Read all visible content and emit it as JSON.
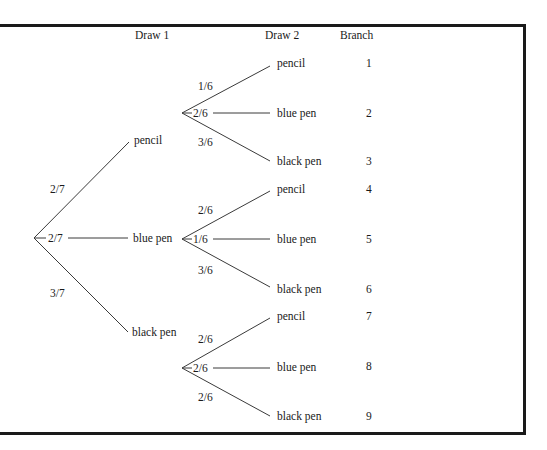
{
  "headers": {
    "draw1": "Draw 1",
    "draw2": "Draw 2",
    "branch": "Branch"
  },
  "colors": {
    "line": "#3a3a3a",
    "border": "#1a1a1a",
    "background": "#ffffff"
  },
  "root": {
    "branches": [
      {
        "prob": "2/7",
        "item": "pencil"
      },
      {
        "prob": "2/7",
        "item": "blue pen"
      },
      {
        "prob": "3/7",
        "item": "black pen"
      }
    ]
  },
  "second_draw": [
    {
      "from": "pencil",
      "branches": [
        {
          "prob": "1/6",
          "item": "pencil",
          "branch": "1"
        },
        {
          "prob": "2/6",
          "item": "blue pen",
          "branch": "2"
        },
        {
          "prob": "3/6",
          "item": "black pen",
          "branch": "3"
        }
      ]
    },
    {
      "from": "blue pen",
      "branches": [
        {
          "prob": "2/6",
          "item": "pencil",
          "branch": "4"
        },
        {
          "prob": "1/6",
          "item": "blue pen",
          "branch": "5"
        },
        {
          "prob": "3/6",
          "item": "black pen",
          "branch": "6"
        }
      ]
    },
    {
      "from": "black pen",
      "branches": [
        {
          "prob": "2/6",
          "item": "pencil",
          "branch": "7"
        },
        {
          "prob": "2/6",
          "item": "blue pen",
          "branch": "8"
        },
        {
          "prob": "2/6",
          "item": "black pen",
          "branch": "9"
        }
      ]
    }
  ]
}
